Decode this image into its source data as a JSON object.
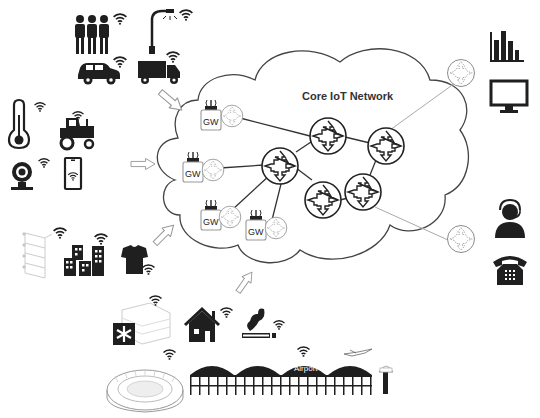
{
  "diagram": {
    "title": "Core IoT Network",
    "gateway_label": "GW",
    "airport_label": "Airport",
    "colors": {
      "icon": "#1f1f1f",
      "line": "#333333",
      "light_line": "#aaaaaa",
      "background": "#ffffff"
    },
    "device_groups": [
      {
        "name": "people-vehicles",
        "icons": [
          "people-icon",
          "street-lamp-icon",
          "car-icon",
          "truck-icon"
        ]
      },
      {
        "name": "home-farm",
        "icons": [
          "thermometer-icon",
          "tractor-icon",
          "webcam-icon",
          "smartphone-icon"
        ]
      },
      {
        "name": "industry-wearables",
        "icons": [
          "shelves-icon",
          "buildings-icon",
          "tshirt-icon"
        ]
      },
      {
        "name": "city-infrastructure",
        "icons": [
          "hospital-icon",
          "house-icon",
          "smoke-icon",
          "stadium-icon",
          "airport-icon"
        ]
      }
    ],
    "services": [
      "bar-chart-icon",
      "monitor-icon",
      "call-center-icon",
      "telephone-icon"
    ],
    "gateways": 4,
    "core_routers": 5,
    "edge_routers": 2
  }
}
